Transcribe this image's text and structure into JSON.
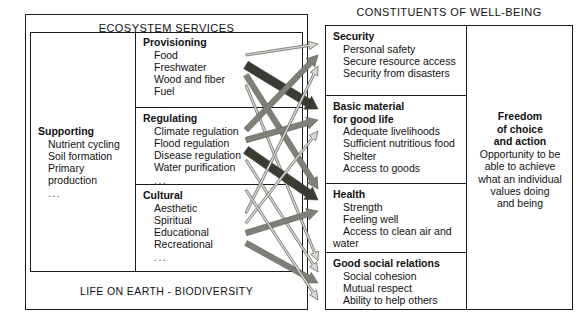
{
  "left_panel": {
    "title": "ECOSYSTEM SERVICES",
    "footer": "LIFE ON EARTH - BIODIVERSITY",
    "supporting": {
      "heading": "Supporting",
      "items": [
        "Nutrient cycling",
        "Soil formation",
        "Primary production"
      ],
      "ellipsis": "..."
    },
    "categories": [
      {
        "heading": "Provisioning",
        "items": [
          "Food",
          "Freshwater",
          "Wood and fiber",
          "Fuel"
        ],
        "ellipsis": "..."
      },
      {
        "heading": "Regulating",
        "items": [
          "Climate regulation",
          "Flood regulation",
          "Disease regulation",
          "Water purification"
        ],
        "ellipsis": "..."
      },
      {
        "heading": "Cultural",
        "items": [
          "Aesthetic",
          "Spiritual",
          "Educational",
          "Recreational"
        ],
        "ellipsis": "..."
      }
    ]
  },
  "right_panel": {
    "title": "CONSTITUENTS OF WELL-BEING",
    "categories": [
      {
        "heading": "Security",
        "heading2": "",
        "items": [
          "Personal safety",
          "Secure resource access",
          "Security from disasters"
        ]
      },
      {
        "heading": "Basic material",
        "heading2": "for good life",
        "items": [
          "Adequate livelihoods",
          "Sufficient nutritious food",
          "Shelter",
          "Access to goods"
        ]
      },
      {
        "heading": "Health",
        "heading2": "",
        "items": [
          "Strength",
          "Feeling well",
          "Access to clean air and",
          "water"
        ]
      },
      {
        "heading": "Good social relations",
        "heading2": "",
        "items": [
          "Social cohesion",
          "Mutual respect",
          "Ability to help others"
        ]
      }
    ],
    "freedom": {
      "heading_line1": "Freedom",
      "heading_line2": "of choice",
      "heading_line3": "and action",
      "text_line1": "Opportunity to be",
      "text_line2": "able to achieve",
      "text_line3": "what an individual",
      "text_line4": "values doing",
      "text_line5": "and being"
    }
  },
  "colors": {
    "arrow_strong": "#3b3b34",
    "arrow_medium": "#808079",
    "arrow_weak": "#d8d8d2",
    "arrow_outline": "#5a5a54",
    "border": "#1a1a1a",
    "text": "#111111",
    "background": "#ffffff"
  },
  "arrow_data": {
    "description": "Linkages between ecosystem service categories and constituents of well-being. Line width denotes intensity of linkage; color denotes potential for mediation by socioeconomic factors.",
    "width_classes": [
      "strong",
      "medium",
      "weak"
    ],
    "links": [
      {
        "from": "Provisioning",
        "to": "Security",
        "intensity": "weak"
      },
      {
        "from": "Provisioning",
        "to": "Basic material",
        "intensity": "strong"
      },
      {
        "from": "Provisioning",
        "to": "Health",
        "intensity": "medium"
      },
      {
        "from": "Provisioning",
        "to": "Good social relations",
        "intensity": "weak"
      },
      {
        "from": "Regulating",
        "to": "Security",
        "intensity": "medium"
      },
      {
        "from": "Regulating",
        "to": "Basic material",
        "intensity": "medium"
      },
      {
        "from": "Regulating",
        "to": "Health",
        "intensity": "strong"
      },
      {
        "from": "Regulating",
        "to": "Good social relations",
        "intensity": "weak"
      },
      {
        "from": "Cultural",
        "to": "Security",
        "intensity": "weak"
      },
      {
        "from": "Cultural",
        "to": "Basic material",
        "intensity": "weak"
      },
      {
        "from": "Cultural",
        "to": "Health",
        "intensity": "medium"
      },
      {
        "from": "Cultural",
        "to": "Good social relations",
        "intensity": "medium"
      },
      {
        "from": "Supporting",
        "to": "Freedom of choice and action",
        "intensity": "weak"
      }
    ]
  }
}
